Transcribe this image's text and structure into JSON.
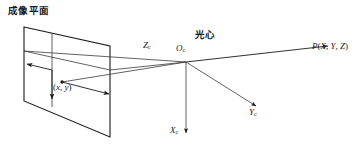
{
  "diagram": {
    "title": "成像平面",
    "type": "pinhole-camera-projection-diagram",
    "labels": {
      "image_plane": "成像平面",
      "optical_center_cjk": "光心",
      "optical_center_symbol": "O",
      "optical_center_subscript": "c",
      "axis_z": "Z",
      "axis_z_subscript": "c",
      "axis_x": "X",
      "axis_x_subscript": "c",
      "axis_y": "Y",
      "axis_y_subscript": "c",
      "image_point_open": "(",
      "image_point_x": "x",
      "image_point_comma": ", ",
      "image_point_y": "y",
      "image_point_close": ")",
      "world_point_name": "P",
      "world_point_open": "(",
      "world_point_X": "X",
      "world_point_comma1": ", ",
      "world_point_Y": "Y",
      "world_point_comma2": ", ",
      "world_point_Z": "Z",
      "world_point_close": ")"
    },
    "colors": {
      "stroke": "#1a1a1a",
      "thin_stroke": "#555555",
      "background": "#ffffff"
    }
  }
}
